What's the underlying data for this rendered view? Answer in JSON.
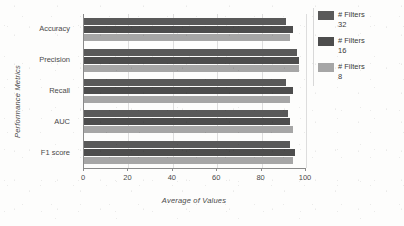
{
  "chart_data": {
    "type": "bar",
    "orientation": "horizontal",
    "title": "",
    "xlabel": "Average of Values",
    "ylabel": "Performance Metrics",
    "categories": [
      "Accuracy",
      "Precision",
      "Recall",
      "AUC",
      "F1 score"
    ],
    "xlim": [
      0,
      100
    ],
    "xticks": [
      0,
      20,
      40,
      60,
      80,
      100
    ],
    "grid": true,
    "legend_position": "right",
    "series": [
      {
        "name": "# Filters 32",
        "name_line1": "# Filters",
        "name_line2": "32",
        "color": "#595959",
        "values": [
          91,
          96,
          91,
          92,
          93
        ]
      },
      {
        "name": "# Filters 16",
        "name_line1": "# Filters",
        "name_line2": "16",
        "color": "#4d4d4d",
        "values": [
          94,
          97,
          94,
          93,
          95
        ]
      },
      {
        "name": "# Filters 8",
        "name_line1": "# Filters",
        "name_line2": "8",
        "color": "#a6a6a6",
        "values": [
          93,
          97,
          93,
          94,
          94
        ]
      }
    ]
  },
  "axes": {
    "x_title": "Average of Values",
    "y_title": "Performance Metrics",
    "tick_labels": [
      "0",
      "20",
      "40",
      "60",
      "80",
      "100"
    ],
    "category_labels": [
      "Accuracy",
      "Precision",
      "Recall",
      "AUC",
      "F1 score"
    ]
  },
  "legend": {
    "items": [
      {
        "line1": "# Filters",
        "line2": "32",
        "color": "#595959"
      },
      {
        "line1": "# Filters",
        "line2": "16",
        "color": "#4d4d4d"
      },
      {
        "line1": "# Filters",
        "line2": "8",
        "color": "#a6a6a6"
      }
    ]
  }
}
